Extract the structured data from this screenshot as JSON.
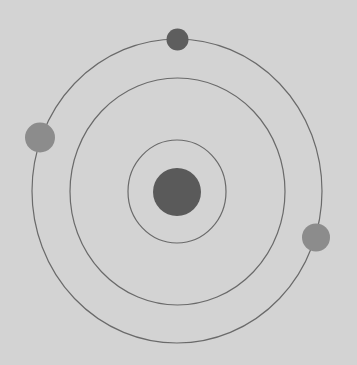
{
  "diagram": {
    "type": "atom-orbital-model",
    "width": 357,
    "height": 365,
    "colors": {
      "background": "#d3d3d3",
      "orbit_stroke": "#6a6a6a",
      "nucleus": "#5a5a5a",
      "electron_dark": "#5e5e5e",
      "electron_light": "#8c8c8c"
    },
    "nucleus": {
      "cx": 177,
      "cy": 192,
      "rx": 24,
      "ry": 24,
      "color": "#5a5a5a"
    },
    "orbits": [
      {
        "name": "inner",
        "cx": 177,
        "cy": 191.5,
        "rx": 49,
        "ry": 51.5
      },
      {
        "name": "middle",
        "cx": 177.5,
        "cy": 191.5,
        "rx": 107.5,
        "ry": 113.5
      },
      {
        "name": "outer",
        "cx": 177,
        "cy": 191,
        "rx": 145,
        "ry": 152
      }
    ],
    "electrons": [
      {
        "name": "top",
        "orbit": "outer",
        "cx": 177.5,
        "cy": 39.5,
        "r": 11,
        "color": "#5e5e5e"
      },
      {
        "name": "left",
        "orbit": "outer",
        "cx": 40,
        "cy": 137.5,
        "r": 15,
        "color": "#8c8c8c"
      },
      {
        "name": "right",
        "orbit": "outer",
        "cx": 316,
        "cy": 237.5,
        "r": 14,
        "color": "#8c8c8c"
      }
    ]
  }
}
